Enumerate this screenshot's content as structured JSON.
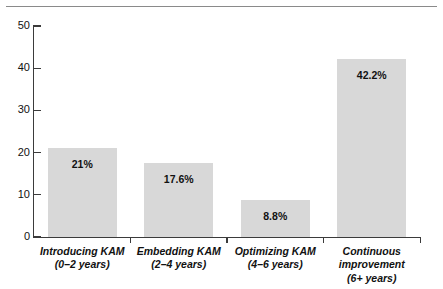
{
  "chart_data": {
    "type": "bar",
    "title": "",
    "subtitle": "",
    "xlabel": "",
    "ylabel": "",
    "ylim": [
      0,
      50
    ],
    "yticks": [
      0,
      10,
      20,
      30,
      40,
      50
    ],
    "ytick_labels": [
      "0",
      "10",
      "20",
      "30",
      "40",
      "50"
    ],
    "grid": false,
    "legend": "none",
    "bar_color": "#d8d8d8",
    "axis_color": "#3b3b3b",
    "text_color": "#111111",
    "categories": [
      "Introducing KAM (0–2 years)",
      "Embedding KAM (2–4 years)",
      "Optimizing KAM (4–6 years)",
      "Continuous improvement (6+ years)"
    ],
    "values": [
      21,
      17.6,
      8.8,
      42.2
    ],
    "data_labels": [
      "21%",
      "17.6%",
      "8.8%",
      "42.2%"
    ],
    "bars": [
      {
        "name": "Introducing KAM",
        "label_line1": "Introducing KAM",
        "label_line2": "(0–2 years)",
        "label_line3": "",
        "value": 21,
        "data_label": "21%"
      },
      {
        "name": "Embedding KAM",
        "label_line1": "Embedding KAM",
        "label_line2": "(2–4 years)",
        "label_line3": "",
        "value": 17.6,
        "data_label": "17.6%"
      },
      {
        "name": "Optimizing KAM",
        "label_line1": "Optimizing KAM",
        "label_line2": "(4–6 years)",
        "label_line3": "",
        "value": 8.8,
        "data_label": "8.8%"
      },
      {
        "name": "Continuous improvement",
        "label_line1": "Continuous",
        "label_line2": "improvement",
        "label_line3": "(6+ years)",
        "value": 42.2,
        "data_label": "42.2%"
      }
    ]
  }
}
